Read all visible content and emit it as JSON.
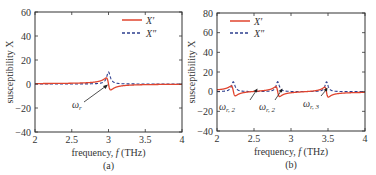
{
  "colors": {
    "real": "#e0442e",
    "imag": "#2e3f8f",
    "axis": "#333333"
  },
  "chart_data": [
    {
      "type": "line",
      "panel": "(a)",
      "caption": "(a)",
      "xlabel": "frequency, f (THz)",
      "ylabel": "susceptibility X",
      "xlim": [
        2,
        4
      ],
      "ylim": [
        -40,
        60
      ],
      "xticks": [
        "2",
        "2.5",
        "3",
        "3.5",
        "4"
      ],
      "yticks": [
        "-40",
        "-20",
        "0",
        "20",
        "40",
        "60"
      ],
      "legend": [
        "X'",
        "X''"
      ],
      "legend_position": "upper right",
      "annotations": [
        {
          "text": "ωr",
          "x": 3.0,
          "y": 0
        }
      ],
      "resonances": [
        {
          "f0": 3.0,
          "gamma": 0.03,
          "amp": 1.8
        }
      ],
      "series": [
        {
          "name": "X'",
          "style": "solid",
          "x": [
            2.0,
            2.5,
            2.8,
            2.9,
            2.97,
            3.0,
            3.03,
            3.1,
            3.2,
            3.5,
            4.0
          ],
          "values": [
            2,
            3.5,
            8,
            15,
            30,
            0,
            -30,
            -15,
            -8,
            -3.5,
            -2
          ]
        },
        {
          "name": "X''",
          "style": "dashed",
          "x": [
            2.0,
            2.5,
            2.8,
            2.9,
            2.97,
            3.0,
            3.03,
            3.1,
            3.2,
            3.5,
            4.0
          ],
          "values": [
            0,
            0.2,
            1.2,
            4.5,
            30,
            60,
            30,
            4.5,
            1.2,
            0.2,
            0
          ]
        }
      ]
    },
    {
      "type": "line",
      "panel": "(b)",
      "caption": "(b)",
      "xlabel": "frequency, f (THz)",
      "ylabel": "susceptibility X",
      "xlim": [
        2,
        4
      ],
      "ylim": [
        -40,
        80
      ],
      "xticks": [
        "2",
        "2.5",
        "3",
        "3.5",
        "4"
      ],
      "yticks": [
        "-40",
        "-20",
        "0",
        "20",
        "40",
        "60",
        "80"
      ],
      "legend": [
        "X'",
        "X''"
      ],
      "legend_position": "upper left",
      "annotations": [
        {
          "text": "ωr, 2",
          "x": 2.22,
          "y": 0
        },
        {
          "text": "ωr, 2",
          "x": 2.82,
          "y": 0
        },
        {
          "text": "ωr, 3",
          "x": 3.48,
          "y": 0
        }
      ],
      "resonances": [
        {
          "f0": 2.22,
          "gamma": 0.028,
          "amp": 1.25
        },
        {
          "f0": 2.82,
          "gamma": 0.026,
          "amp": 1.48
        },
        {
          "f0": 3.48,
          "gamma": 0.025,
          "amp": 1.75
        }
      ],
      "series": [
        {
          "name": "X'",
          "style": "solid",
          "x": [
            2.0,
            2.2,
            2.22,
            2.25,
            2.45,
            2.8,
            2.82,
            2.86,
            3.15,
            3.46,
            3.48,
            3.52,
            4.0
          ],
          "values": [
            5,
            25,
            0,
            -18,
            0,
            30,
            0,
            -25,
            0,
            35,
            0,
            -33,
            3
          ]
        },
        {
          "name": "X''",
          "style": "dashed",
          "x": [
            2.0,
            2.22,
            2.5,
            2.82,
            3.15,
            3.48,
            4.0
          ],
          "values": [
            0.5,
            45,
            1,
            57,
            1,
            70,
            0.5
          ]
        }
      ]
    }
  ],
  "panels": {
    "a": {
      "caption": "(a)",
      "xlabel_pre": "frequency, ",
      "xlabel_var": "f",
      "xlabel_post": " (THz)",
      "ylabel": "susceptibility X",
      "legend_real": "X′",
      "legend_imag": "X″",
      "annotation": "ω",
      "annotation_sub": "r",
      "xticks": [
        "2",
        "2.5",
        "3",
        "3.5",
        "4"
      ],
      "yticks": [
        "60",
        "40",
        "20",
        "0",
        "−20",
        "−40"
      ]
    },
    "b": {
      "caption": "(b)",
      "xlabel_pre": "frequency, ",
      "xlabel_var": "f",
      "xlabel_post": " (THz)",
      "ylabel": "susceptibility X",
      "legend_real": "X′",
      "legend_imag": "X″",
      "annotations": [
        {
          "w": "ω",
          "sub": "r, 2"
        },
        {
          "w": "ω",
          "sub": "r, 2"
        },
        {
          "w": "ω",
          "sub": "r, 3"
        }
      ],
      "xticks": [
        "2",
        "2.5",
        "3",
        "3.5",
        "4"
      ],
      "yticks": [
        "80",
        "60",
        "40",
        "20",
        "0",
        "−20",
        "−40"
      ]
    }
  }
}
